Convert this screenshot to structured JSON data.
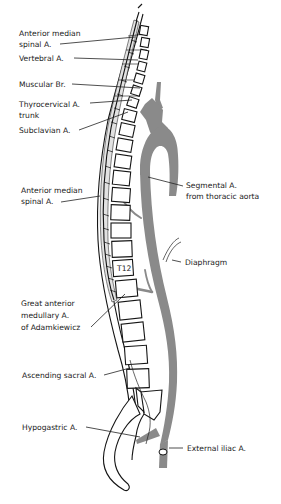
{
  "diagram": {
    "labels": {
      "anterior_median_spinal_upper": [
        "Anterior median",
        "spinal A."
      ],
      "vertebral": "Vertebral A.",
      "muscular_br": "Muscular Br.",
      "thyrocervical": [
        "Thyrocervical A.",
        "trunk"
      ],
      "subclavian": "Subclavian A.",
      "anterior_median_spinal_lower": [
        "Anterior median",
        "spinal A."
      ],
      "segmental": [
        "Segmental A.",
        "from thoracic aorta"
      ],
      "diaphragm": "Diaphragm",
      "adamkiewicz": [
        "Great anterior",
        "medullary A.",
        "of Adamkiewicz"
      ],
      "ascending_sacral": "Ascending sacral A.",
      "hypogastric": "Hypogastric A.",
      "external_iliac": "External iliac A.",
      "vertebra_t12": "T12"
    },
    "colors": {
      "vessel": "#8a8a8a",
      "outline": "#151515",
      "background": "#ffffff"
    }
  }
}
